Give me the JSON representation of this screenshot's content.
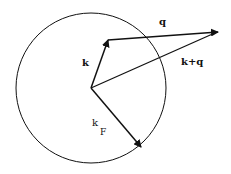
{
  "diagram": {
    "title": "",
    "circle": {
      "cx": 91,
      "cy": 88,
      "r": 75
    },
    "vectors": [
      {
        "name": "k",
        "x1": 91,
        "y1": 88,
        "x2": 108,
        "y2": 40
      },
      {
        "name": "q",
        "x1": 108,
        "y1": 40,
        "x2": 218,
        "y2": 32
      },
      {
        "name": "k+q",
        "x1": 91,
        "y1": 88,
        "x2": 218,
        "y2": 32
      },
      {
        "name": "kF",
        "x1": 91,
        "y1": 88,
        "x2": 141,
        "y2": 147
      }
    ],
    "labels": {
      "k": "k",
      "q": "q",
      "k_plus_q": "k+q",
      "kF_main": "k",
      "kF_sub": "F"
    },
    "colors": {
      "stroke": "#111111",
      "background": "#ffffff"
    }
  }
}
